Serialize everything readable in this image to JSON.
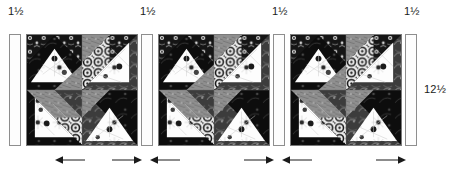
{
  "diagram": {
    "type": "quilt-row-assembly-diagram",
    "top_labels": [
      {
        "text": "1½",
        "x": 8
      },
      {
        "text": "1½",
        "x": 140
      },
      {
        "text": "1½",
        "x": 272
      },
      {
        "text": "1½",
        "x": 404
      }
    ],
    "side_label": {
      "text": "12½",
      "x": 424,
      "y": 84
    },
    "strips": [
      {
        "name": "sashing-strip-1",
        "x": 9,
        "width_label": "1½"
      },
      {
        "name": "sashing-strip-2",
        "x": 141,
        "width_label": "1½"
      },
      {
        "name": "sashing-strip-3",
        "x": 273,
        "width_label": "1½"
      },
      {
        "name": "sashing-strip-4",
        "x": 405,
        "width_label": "1½"
      }
    ],
    "blocks": [
      {
        "name": "quilt-block-1",
        "x": 26,
        "size_label": "12½"
      },
      {
        "name": "quilt-block-2",
        "x": 158,
        "size_label": "12½"
      },
      {
        "name": "quilt-block-3",
        "x": 290,
        "size_label": "12½"
      }
    ],
    "arrow_groups": [
      {
        "name": "arrow-pair-1",
        "left_x": 55,
        "right_x": 112,
        "y": 155
      },
      {
        "name": "arrow-pair-2",
        "left_x": 150,
        "right_x": 244,
        "y": 155
      },
      {
        "name": "arrow-pair-3",
        "left_x": 282,
        "right_x": 376,
        "y": 155
      }
    ],
    "colors": {
      "label_text": "#1a1a1a",
      "strip_fill": "#fdfdfd",
      "strip_border": "#8e8e8e",
      "block_border": "#7a7a7a",
      "arrow": "#1a1a1a",
      "fabric_light": "#ffffff",
      "fabric_mid": "#9a9a9a",
      "fabric_dark": "#1c1c1c",
      "fabric_medium_dark": "#555555"
    }
  }
}
